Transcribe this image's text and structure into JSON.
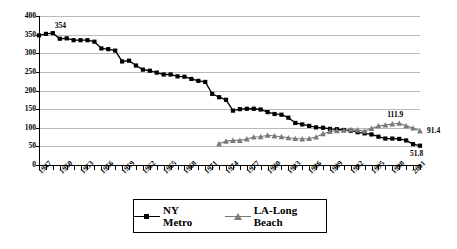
{
  "chart_data": {
    "type": "line",
    "title": "",
    "subtitle": "",
    "xlabel": "",
    "ylabel": "",
    "xlim": [
      1947,
      2002
    ],
    "ylim": [
      0,
      400
    ],
    "ytick_step": 50,
    "ytick_labels": [
      "400",
      "350",
      "300",
      "250",
      "200",
      "150",
      "100",
      "50",
      "0"
    ],
    "ytick_values": [
      400,
      350,
      300,
      250,
      200,
      150,
      100,
      50,
      0
    ],
    "xtick_labels": [
      "1947",
      "1950",
      "1953",
      "1956",
      "1959",
      "1962",
      "1965",
      "1968",
      "1971",
      "1974",
      "1977",
      "1980",
      "1983",
      "1986",
      "1989",
      "1992",
      "1995",
      "1998",
      "2001"
    ],
    "xtick_values": [
      1947,
      1950,
      1953,
      1956,
      1959,
      1962,
      1965,
      1968,
      1971,
      1974,
      1977,
      1980,
      1983,
      1986,
      1989,
      1992,
      1995,
      1998,
      2001
    ],
    "grid": true,
    "grid_color": "#b9b9b9",
    "legend_position": "bottom",
    "x": [
      1947,
      1948,
      1949,
      1950,
      1951,
      1952,
      1953,
      1954,
      1955,
      1956,
      1957,
      1958,
      1959,
      1960,
      1961,
      1962,
      1963,
      1964,
      1965,
      1966,
      1967,
      1968,
      1969,
      1970,
      1971,
      1972,
      1973,
      1974,
      1975,
      1976,
      1977,
      1978,
      1979,
      1980,
      1981,
      1982,
      1983,
      1984,
      1985,
      1986,
      1987,
      1988,
      1989,
      1990,
      1991,
      1992,
      1993,
      1994,
      1995,
      1996,
      1997,
      1998,
      1999,
      2000,
      2001,
      2002
    ],
    "series": [
      {
        "name": "NY Metro",
        "color": "#000000",
        "marker": "square",
        "values": [
          348,
          352,
          354,
          339,
          340,
          335,
          335,
          335,
          331,
          313,
          311,
          307,
          278,
          280,
          267,
          256,
          253,
          248,
          243,
          243,
          238,
          237,
          231,
          226,
          223,
          191,
          182,
          175,
          146,
          150,
          151,
          151,
          149,
          142,
          137,
          135,
          127,
          113,
          109,
          105,
          101,
          100,
          97,
          96,
          94,
          92,
          88,
          85,
          82,
          76,
          71,
          71,
          70,
          66,
          56,
          51.8
        ]
      },
      {
        "name": "LA-Long Beach",
        "color": "#7a7a7a",
        "marker": "triangle",
        "values": [
          null,
          null,
          null,
          null,
          null,
          null,
          null,
          null,
          null,
          null,
          null,
          null,
          null,
          null,
          null,
          null,
          null,
          null,
          null,
          null,
          null,
          null,
          null,
          null,
          null,
          null,
          57,
          64,
          66,
          66,
          70,
          75,
          76,
          80,
          78,
          76,
          73,
          71,
          70,
          71,
          75,
          84,
          90,
          92,
          93,
          95,
          94,
          91,
          98,
          105,
          107,
          110,
          111.9,
          105,
          99,
          91.4
        ]
      }
    ],
    "annotations": [
      {
        "label": "354",
        "x": 1949,
        "y": 354
      },
      {
        "label": "111.9",
        "x": 1999,
        "y": 111.9
      },
      {
        "label": "91.4",
        "x": 2002,
        "y": 91.4
      },
      {
        "label": "51.8",
        "x": 2002,
        "y": 51.8
      }
    ]
  },
  "legend": {
    "items": [
      {
        "label": "NY Metro"
      },
      {
        "label": "LA-Long Beach"
      }
    ]
  }
}
